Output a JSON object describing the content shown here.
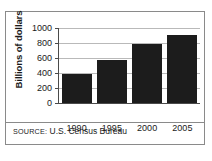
{
  "figure": {
    "source_prefix": "SOURCE:",
    "source_text": "U.S. Census Bureau"
  },
  "chart_data": {
    "type": "bar",
    "title": "",
    "xlabel": "",
    "ylabel": "Billions of dollars",
    "categories": [
      "1990",
      "1995",
      "2000",
      "2005"
    ],
    "values": [
      390,
      580,
      785,
      910
    ],
    "ylim": [
      0,
      1000
    ],
    "yticks": [
      0,
      200,
      400,
      600,
      800,
      1000
    ],
    "ytick_labels": [
      "0",
      "200",
      "400",
      "600",
      "800",
      "1000"
    ],
    "grid": true,
    "legend": false,
    "bar_color": "#1c1c1c",
    "axis_color": "#4a4a4a",
    "grid_color": "#b9b9b9"
  }
}
